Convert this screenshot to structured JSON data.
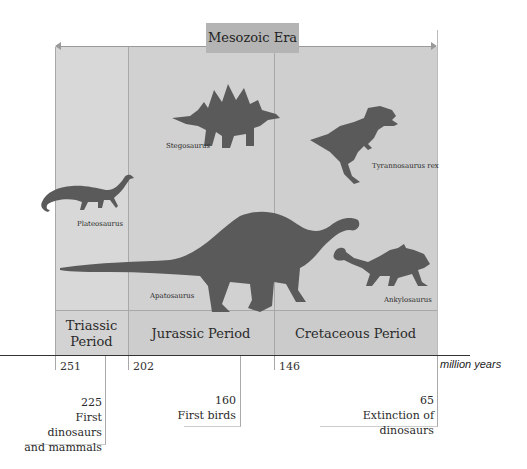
{
  "era": {
    "label": "Mesozoic Era"
  },
  "periods": [
    {
      "name": "Triassic\nPeriod",
      "line1": "Triassic",
      "line2": "Period",
      "start": "251"
    },
    {
      "name": "Jurassic Period",
      "start": "202"
    },
    {
      "name": "Cretaceous Period",
      "start": "146"
    }
  ],
  "axis": {
    "unit": "million years"
  },
  "events": [
    {
      "value": "225",
      "line1": "First dinosaurs",
      "line2": "and mammals"
    },
    {
      "value": "160",
      "line1": "First birds"
    },
    {
      "value": "65",
      "line1": "Extinction of dinosaurs"
    }
  ],
  "dinosaurs": [
    {
      "name": "Plateosaurus",
      "period": "Triassic"
    },
    {
      "name": "Stegosaurus",
      "period": "Jurassic"
    },
    {
      "name": "Apatosaurus",
      "period": "Jurassic"
    },
    {
      "name": "Tyrannosaurus rex",
      "period": "Cretaceous"
    },
    {
      "name": "Ankylosaurus",
      "period": "Cretaceous"
    }
  ],
  "colors": {
    "silhouette": "#5a5a5a",
    "region": "#d3d3d3",
    "era_box": "#b4b4b4"
  }
}
